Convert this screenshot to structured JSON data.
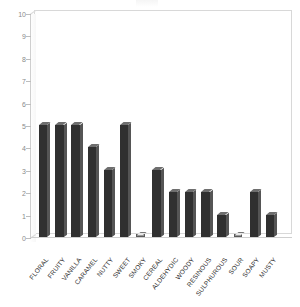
{
  "chart_data": {
    "type": "bar",
    "title": "",
    "xlabel": "",
    "ylabel": "",
    "ylim": [
      0,
      10
    ],
    "ytick_step": 1,
    "yticks": [
      0,
      1,
      2,
      3,
      4,
      5,
      6,
      7,
      8,
      9,
      10
    ],
    "grid": false,
    "legend": "none",
    "style": "3d-column",
    "bar_color": "#303030",
    "bar_side_color": "#555555",
    "bar_top_color": "#6e6e6e",
    "axis_color": "#cfcfcf",
    "categories": [
      "FLORAL",
      "FRUITY",
      "VANILLA",
      "CARAMEL",
      "NUTTY",
      "SWEET",
      "SMOKY",
      "CEREAL",
      "ALDEHYDIC",
      "WOODY",
      "RESINOUS",
      "SULPHUROUS",
      "SOUR",
      "SOAPY",
      "MUSTY"
    ],
    "values": [
      5,
      5,
      5,
      4,
      3,
      5,
      0,
      3,
      2,
      2,
      2,
      1,
      0,
      2,
      1
    ]
  }
}
